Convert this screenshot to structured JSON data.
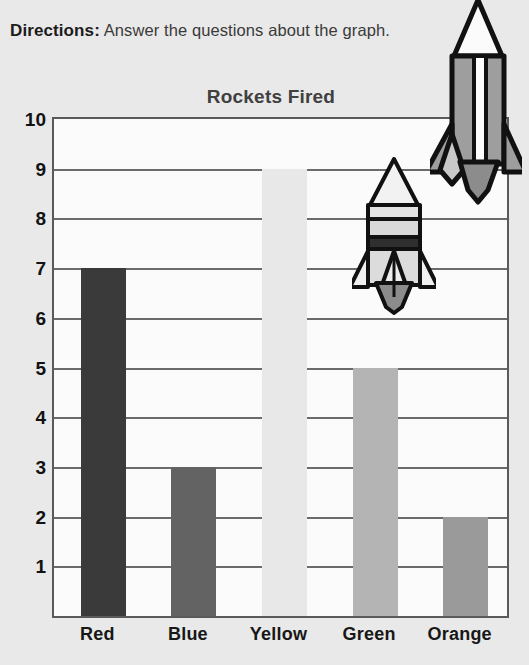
{
  "worksheet": {
    "directions_label": "Directions:",
    "directions_text": "Answer the questions about the graph."
  },
  "chart_data": {
    "type": "bar",
    "title": "Rockets Fired",
    "xlabel": "",
    "ylabel": "",
    "categories": [
      "Red",
      "Blue",
      "Yellow",
      "Green",
      "Orange"
    ],
    "values": [
      7,
      3,
      9,
      5,
      2
    ],
    "ylim": [
      0,
      10
    ],
    "yticks": [
      "10",
      "9",
      "8",
      "7",
      "6",
      "5",
      "4",
      "3",
      "2",
      "1"
    ],
    "grid": true,
    "legend": "none",
    "bar_colors": [
      "#3a3a3a",
      "#636363",
      "#e8e8e8",
      "#b4b4b4",
      "#9a9a9a"
    ]
  },
  "decorations": {
    "rocket_small": "rocket-icon",
    "rocket_large": "rocket-icon"
  },
  "colors": {
    "page_background": "#e9e9e9",
    "plot_background": "#fbfbfb",
    "axis_line": "#5a5a5a",
    "gridline": "#6b6b6b",
    "title_text": "#40403f",
    "tick_text": "#121212"
  }
}
